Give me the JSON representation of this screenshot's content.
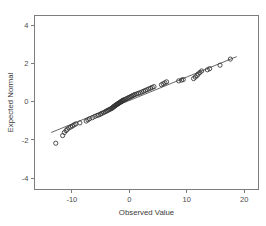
{
  "chart_data": {
    "type": "scatter",
    "title": "",
    "subtitle": "",
    "xlabel": "Observed Value",
    "ylabel": "Expected Normal",
    "xlim": [
      -16.5,
      22.5
    ],
    "ylim": [
      -4.6,
      4.5
    ],
    "xticks": [
      -10,
      0,
      10,
      20
    ],
    "xtick_labels": [
      "-10",
      "0",
      "10",
      "20"
    ],
    "yticks": [
      4,
      2,
      0,
      -2,
      -4
    ],
    "ytick_labels": [
      "4",
      "2",
      "0",
      "-2",
      "-4"
    ],
    "grid": false,
    "legend": false,
    "legend_position": "none",
    "marker": "open-circle",
    "marker_color": "#333333",
    "reference_line": {
      "label": "normal reference line",
      "color": "#404040",
      "x_start": -13.6,
      "y_start": -1.62,
      "x_end": 18.7,
      "y_end": 2.35
    },
    "series": [
      {
        "name": "Observed vs Expected Normal",
        "points": [
          [
            -12.8,
            -2.18
          ],
          [
            -11.6,
            -1.78
          ],
          [
            -11.3,
            -1.62
          ],
          [
            -11.0,
            -1.52
          ],
          [
            -10.8,
            -1.45
          ],
          [
            -10.5,
            -1.38
          ],
          [
            -10.2,
            -1.33
          ],
          [
            -9.9,
            -1.28
          ],
          [
            -9.6,
            -1.22
          ],
          [
            -9.3,
            -1.17
          ],
          [
            -8.6,
            -1.12
          ],
          [
            -7.5,
            -1.02
          ],
          [
            -7.2,
            -0.96
          ],
          [
            -6.9,
            -0.9
          ],
          [
            -6.4,
            -0.84
          ],
          [
            -6.0,
            -0.78
          ],
          [
            -5.6,
            -0.73
          ],
          [
            -5.3,
            -0.7
          ],
          [
            -5.0,
            -0.66
          ],
          [
            -4.8,
            -0.62
          ],
          [
            -4.5,
            -0.58
          ],
          [
            -4.2,
            -0.54
          ],
          [
            -4.0,
            -0.5
          ],
          [
            -3.8,
            -0.47
          ],
          [
            -3.6,
            -0.44
          ],
          [
            -3.4,
            -0.41
          ],
          [
            -3.2,
            -0.38
          ],
          [
            -3.0,
            -0.35
          ],
          [
            -2.9,
            -0.32
          ],
          [
            -2.8,
            -0.29
          ],
          [
            -2.7,
            -0.27
          ],
          [
            -2.6,
            -0.25
          ],
          [
            -2.5,
            -0.22
          ],
          [
            -2.4,
            -0.2
          ],
          [
            -2.3,
            -0.18
          ],
          [
            -2.2,
            -0.16
          ],
          [
            -2.1,
            -0.14
          ],
          [
            -2.0,
            -0.12
          ],
          [
            -1.9,
            -0.1
          ],
          [
            -1.8,
            -0.08
          ],
          [
            -1.7,
            -0.06
          ],
          [
            -1.6,
            -0.04
          ],
          [
            -1.5,
            -0.02
          ],
          [
            -1.4,
            0.0
          ],
          [
            -1.3,
            0.02
          ],
          [
            -1.2,
            0.04
          ],
          [
            -1.1,
            0.06
          ],
          [
            -1.0,
            0.08
          ],
          [
            -0.8,
            0.1
          ],
          [
            -0.6,
            0.13
          ],
          [
            -0.4,
            0.16
          ],
          [
            -0.2,
            0.19
          ],
          [
            0.0,
            0.22
          ],
          [
            0.2,
            0.25
          ],
          [
            0.4,
            0.28
          ],
          [
            0.6,
            0.31
          ],
          [
            0.8,
            0.34
          ],
          [
            1.0,
            0.37
          ],
          [
            1.3,
            0.4
          ],
          [
            1.6,
            0.43
          ],
          [
            1.9,
            0.46
          ],
          [
            2.2,
            0.5
          ],
          [
            2.5,
            0.54
          ],
          [
            2.8,
            0.58
          ],
          [
            3.1,
            0.62
          ],
          [
            3.4,
            0.66
          ],
          [
            3.7,
            0.7
          ],
          [
            4.0,
            0.74
          ],
          [
            4.3,
            0.78
          ],
          [
            5.6,
            0.88
          ],
          [
            5.9,
            0.93
          ],
          [
            6.2,
            0.98
          ],
          [
            6.5,
            1.03
          ],
          [
            8.6,
            1.08
          ],
          [
            9.1,
            1.12
          ],
          [
            9.4,
            1.15
          ],
          [
            11.2,
            1.2
          ],
          [
            11.5,
            1.28
          ],
          [
            11.8,
            1.36
          ],
          [
            12.0,
            1.44
          ],
          [
            12.3,
            1.52
          ],
          [
            12.6,
            1.6
          ],
          [
            13.6,
            1.66
          ],
          [
            14.0,
            1.72
          ],
          [
            15.8,
            1.9
          ],
          [
            17.6,
            2.22
          ]
        ]
      }
    ]
  },
  "axes": {
    "x_title": "Observed Value",
    "y_title": "Expected Normal"
  }
}
